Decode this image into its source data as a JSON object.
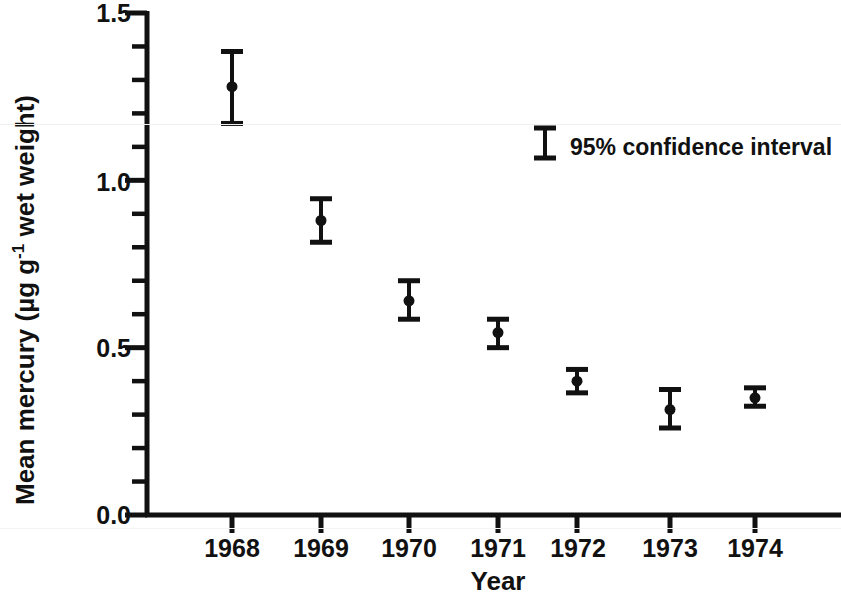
{
  "chart_data": {
    "type": "scatter",
    "title": "",
    "xlabel": "Year",
    "ylabel": "Mean mercury  (µg g⁻¹ wet weight)",
    "ylabel_parts": {
      "prefix": "Mean mercury  (µg g",
      "superscript": "-1",
      "suffix": " wet weight)"
    },
    "categories": [
      "1968",
      "1969",
      "1970",
      "1971",
      "1972",
      "1973",
      "1974"
    ],
    "x": [
      1968,
      1969,
      1970,
      1971,
      1972,
      1973,
      1974
    ],
    "values": [
      1.28,
      0.88,
      0.64,
      0.545,
      0.4,
      0.315,
      0.35
    ],
    "error_low": [
      1.17,
      0.815,
      0.585,
      0.5,
      0.365,
      0.26,
      0.325
    ],
    "error_high": [
      1.385,
      0.945,
      0.7,
      0.585,
      0.435,
      0.375,
      0.38
    ],
    "series": [
      {
        "name": "Mean mercury",
        "values": [
          1.28,
          0.88,
          0.64,
          0.545,
          0.4,
          0.315,
          0.35
        ]
      }
    ],
    "points": [
      {
        "year": "1968",
        "mean": 1.28,
        "ci_low": 1.17,
        "ci_high": 1.385
      },
      {
        "year": "1969",
        "mean": 0.88,
        "ci_low": 0.815,
        "ci_high": 0.945
      },
      {
        "year": "1970",
        "mean": 0.64,
        "ci_low": 0.585,
        "ci_high": 0.7
      },
      {
        "year": "1971",
        "mean": 0.545,
        "ci_low": 0.5,
        "ci_high": 0.585
      },
      {
        "year": "1972",
        "mean": 0.4,
        "ci_low": 0.365,
        "ci_high": 0.435
      },
      {
        "year": "1973",
        "mean": 0.315,
        "ci_low": 0.26,
        "ci_high": 0.375
      },
      {
        "year": "1974",
        "mean": 0.35,
        "ci_low": 0.325,
        "ci_high": 0.38
      }
    ],
    "ylim": [
      0.0,
      1.5
    ],
    "y_major_ticks": [
      "0.0",
      "0.5",
      "1.0",
      "1.5"
    ],
    "y_major_values": [
      0.0,
      0.5,
      1.0,
      1.5
    ],
    "y_minor_values": [
      0.1,
      0.2,
      0.3,
      0.4,
      0.6,
      0.7,
      0.8,
      0.9,
      1.1,
      1.2,
      1.3,
      1.4
    ],
    "xlim": [
      1967.4,
      1975.3
    ],
    "grid": false,
    "legend": {
      "position": "upper-right-inside",
      "entries": [
        {
          "label": "95% confidence interval",
          "symbol": "error-bar"
        }
      ]
    },
    "marker": {
      "shape": "circle",
      "color": "#111111",
      "size": 11
    },
    "errorbar": {
      "color": "#111111",
      "cap_style": "flat-cap"
    }
  },
  "axes": {
    "y_tick_0": "0.0",
    "y_tick_1": "0.5",
    "y_tick_2": "1.0",
    "y_tick_3": "1.5",
    "x_tick_0": "1968",
    "x_tick_1": "1969",
    "x_tick_2": "1970",
    "x_tick_3": "1971",
    "x_tick_4": "1972",
    "x_tick_5": "1973",
    "x_tick_6": "1974",
    "x_axis_title": "Year",
    "y_axis_title_prefix": "Mean mercury  (µg g",
    "y_axis_title_sup": "-1",
    "y_axis_title_suffix": " wet weight)"
  },
  "legend": {
    "ci_label": "95% confidence interval"
  },
  "colors": {
    "ink": "#111111",
    "background": "#ffffff",
    "scan_artifact": "#f0f0ee"
  }
}
